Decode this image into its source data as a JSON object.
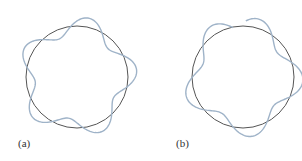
{
  "panels": [
    {
      "id": "a",
      "label": "(a)",
      "description": "Standing wave fits circle (closed, whole number of wavelengths)",
      "circle": {
        "cx": 77,
        "cy": 77,
        "r": 51
      },
      "wave_cycles": 5,
      "closed": true
    },
    {
      "id": "b",
      "label": "(b)",
      "description": "Wave does not fit circle (open ends, non-integer wavelengths)",
      "circle": {
        "cx": 243,
        "cy": 77,
        "r": 51
      },
      "wave_cycles": 4.6,
      "closed": false
    }
  ],
  "colors": {
    "circle": "#555555",
    "wave": "#9fb3c8",
    "label": "#333333"
  }
}
